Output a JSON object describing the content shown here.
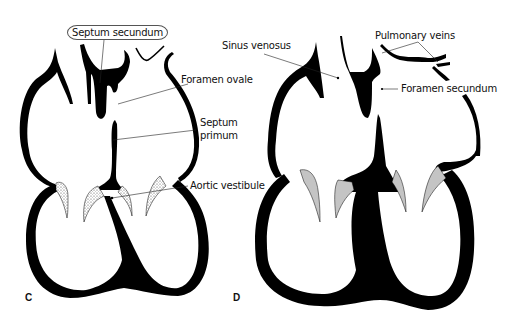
{
  "figure": {
    "panels": [
      {
        "id": "C",
        "letter": "C",
        "labels": {
          "septum_secundum": "Septum secundum",
          "foramen_ovale": "Foramen ovale",
          "septum_primum_line1": "Septum",
          "septum_primum_line2": "primum",
          "aortic_vestibule": "Aortic vestibule"
        }
      },
      {
        "id": "D",
        "letter": "D",
        "labels": {
          "sinus_venosus": "Sinus venosus",
          "pulmonary_veins": "Pulmonary veins",
          "foramen_secundum": "Foramen secundum"
        }
      }
    ],
    "colors": {
      "ink": "#000000",
      "valve_fill": "#c8c8c8",
      "background": "#ffffff"
    }
  }
}
